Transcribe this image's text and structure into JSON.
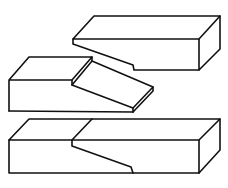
{
  "figure": {
    "stroke_color": "#111111",
    "background_color": "#ffffff",
    "parts": [
      {
        "name": "upper-timber",
        "role": "separated top piece with sloped underside notch"
      },
      {
        "name": "lower-timber",
        "role": "separated piece with stepped sloping tongue"
      },
      {
        "name": "assembled-joint",
        "role": "both pieces joined into one beam"
      }
    ]
  }
}
